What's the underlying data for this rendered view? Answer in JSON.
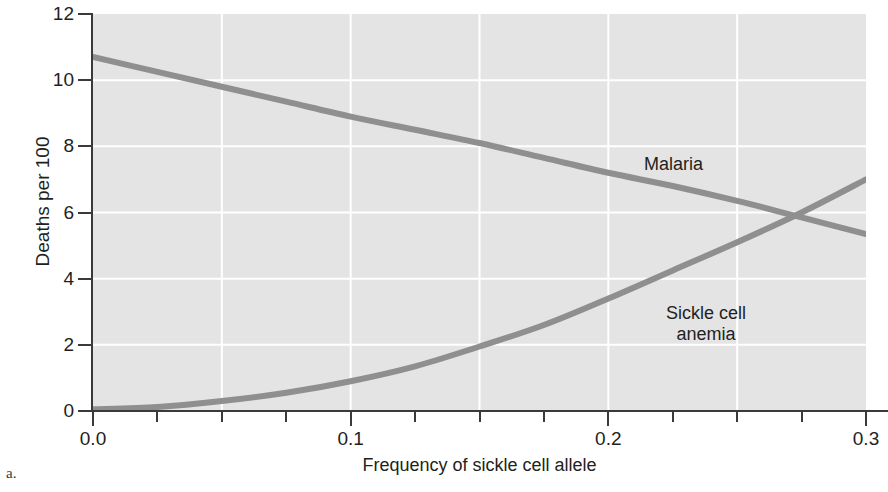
{
  "figure": {
    "panel_letter": "a.",
    "background_color": "#ffffff"
  },
  "chart_data": {
    "type": "line",
    "title": "",
    "subtitle": "",
    "xlabel": "Frequency of sickle cell allele",
    "ylabel": "Deaths per 100",
    "xlim": [
      0.0,
      0.3
    ],
    "ylim": [
      0,
      12
    ],
    "grid": true,
    "grid_color": "#ffffff",
    "plot_background": "#e4e4e4",
    "axis_color": "#3a3a3a",
    "legend_position": "inline-labels",
    "xticks": [
      0.0,
      0.1,
      0.2,
      0.3
    ],
    "xtick_labels": [
      "0.0",
      "0.1",
      "0.2",
      "0.3"
    ],
    "xminor_ticks": [
      0.025,
      0.05,
      0.075,
      0.125,
      0.15,
      0.175,
      0.225,
      0.25,
      0.275
    ],
    "yticks": [
      0,
      2,
      4,
      6,
      8,
      10,
      12
    ],
    "ytick_labels": [
      "0",
      "2",
      "4",
      "6",
      "8",
      "10",
      "12"
    ],
    "series": [
      {
        "name": "Malaria",
        "color": "#8f8f8f",
        "line_width": 6,
        "label_text": "Malaria",
        "x": [
          0.0,
          0.025,
          0.05,
          0.075,
          0.1,
          0.125,
          0.15,
          0.175,
          0.2,
          0.225,
          0.25,
          0.275,
          0.3
        ],
        "values": [
          10.7,
          10.25,
          9.8,
          9.35,
          8.9,
          8.5,
          8.1,
          7.65,
          7.2,
          6.8,
          6.35,
          5.85,
          5.35
        ]
      },
      {
        "name": "Sickle cell anemia",
        "color": "#8f8f8f",
        "line_width": 6,
        "label_text": "Sickle cell\nanemia",
        "x": [
          0.0,
          0.025,
          0.05,
          0.075,
          0.1,
          0.125,
          0.15,
          0.175,
          0.2,
          0.225,
          0.25,
          0.275,
          0.3
        ],
        "values": [
          0.05,
          0.12,
          0.3,
          0.55,
          0.9,
          1.35,
          1.95,
          2.6,
          3.4,
          4.25,
          5.1,
          6.0,
          7.0
        ]
      }
    ],
    "annotations": [
      {
        "text": "Malaria",
        "x": 0.215,
        "y": 7.2
      },
      {
        "text": "Sickle cell anemia",
        "x": 0.205,
        "y": 2.85
      }
    ],
    "intersection": {
      "x": 0.272,
      "y": 5.8
    }
  }
}
